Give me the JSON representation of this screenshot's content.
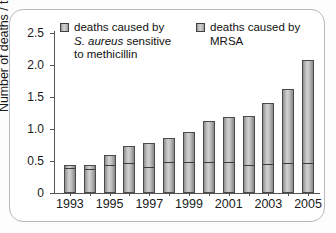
{
  "chart_data": {
    "type": "bar",
    "title": "",
    "subtitle": "",
    "xlabel": "",
    "ylabel": "Number of deaths / thousands",
    "ylim": [
      0,
      2.5
    ],
    "yticks": [
      "0",
      "0.5",
      "1.0",
      "1.5",
      "2.0",
      "2.5"
    ],
    "ytick_values": [
      0,
      0.5,
      1.0,
      1.5,
      2.0,
      2.5
    ],
    "grid": false,
    "stacked": true,
    "legend_position": "top",
    "categories": [
      "1993",
      "1994",
      "1995",
      "1996",
      "1997",
      "1998",
      "1999",
      "2000",
      "2001",
      "2002",
      "2003",
      "2004",
      "2005"
    ],
    "xtick_labels": [
      "1993",
      "1995",
      "1997",
      "1999",
      "2001",
      "2003",
      "2005"
    ],
    "series": [
      {
        "name": "deaths caused by S. aureus sensitive to methicillin",
        "values": [
          0.36,
          0.35,
          0.4,
          0.44,
          0.37,
          0.45,
          0.46,
          0.46,
          0.45,
          0.41,
          0.42,
          0.44,
          0.44
        ]
      },
      {
        "name": "deaths caused by MRSA",
        "values": [
          0.08,
          0.09,
          0.2,
          0.3,
          0.41,
          0.41,
          0.49,
          0.67,
          0.74,
          0.8,
          0.98,
          1.18,
          1.64
        ]
      }
    ],
    "totals": [
      0.44,
      0.44,
      0.6,
      0.74,
      0.78,
      0.86,
      0.95,
      1.13,
      1.19,
      1.21,
      1.4,
      1.62,
      2.08
    ]
  },
  "legend": {
    "sensitive": {
      "line1": "deaths caused by",
      "line2_italic": "S. aureus",
      "line2_rest": " sensitive",
      "line3": "to methicillin"
    },
    "mrsa": {
      "line1": "deaths caused by",
      "line2": "MRSA"
    }
  },
  "colors": {
    "bar_fill_light": "#d2d2d2",
    "bar_fill_dark": "#8e8e8e",
    "bar_border": "#4a4a4a",
    "axis": "#555555",
    "text": "#1a1a1a",
    "frame": "#b8b8b8",
    "background": "#ffffff"
  }
}
